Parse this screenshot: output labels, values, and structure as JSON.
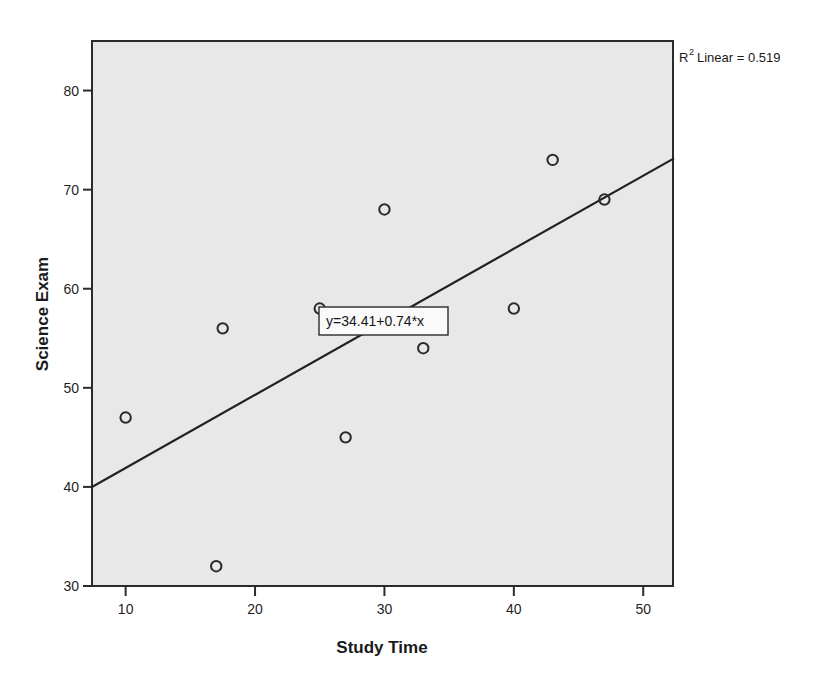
{
  "chart_data": {
    "type": "scatter",
    "title": "",
    "xlabel": "Study Time",
    "ylabel": "Science Exam",
    "xlim": [
      7.4,
      52.3
    ],
    "ylim": [
      30,
      85
    ],
    "xticks": [
      10,
      20,
      30,
      40,
      50
    ],
    "xtick_labels": [
      "10",
      "20",
      "30",
      "40",
      "50"
    ],
    "yticks": [
      30,
      40,
      50,
      60,
      70,
      80
    ],
    "ytick_labels": [
      "30",
      "40",
      "50",
      "60",
      "70",
      "80"
    ],
    "grid": false,
    "legend": false,
    "marker": "open-circle",
    "points": [
      {
        "x": 10,
        "y": 47
      },
      {
        "x": 17,
        "y": 32
      },
      {
        "x": 17.5,
        "y": 56
      },
      {
        "x": 25,
        "y": 58
      },
      {
        "x": 27,
        "y": 45
      },
      {
        "x": 30,
        "y": 68
      },
      {
        "x": 33,
        "y": 54
      },
      {
        "x": 40,
        "y": 58
      },
      {
        "x": 43,
        "y": 73
      },
      {
        "x": 47,
        "y": 69
      }
    ],
    "fit_line": {
      "equation_label": "y=34.41+0.74*x",
      "intercept": 34.41,
      "slope": 0.74,
      "x_start": 7.4,
      "x_end": 52.3,
      "y_start": 40.0,
      "y_end": 73.1
    },
    "annotations": {
      "r2_prefix": "R",
      "r2_superscript": "2",
      "r2_text": "Linear = 0.519",
      "r2_value": 0.519
    },
    "colors": {
      "panel_background": "#e8e8e8",
      "panel_border": "#2b2b2b",
      "marker_stroke": "#2a2a2a",
      "line_stroke": "#202020",
      "text": "#1a1a1a",
      "figure_background": "#ffffff",
      "label_box_fill": "#fafafa"
    }
  }
}
